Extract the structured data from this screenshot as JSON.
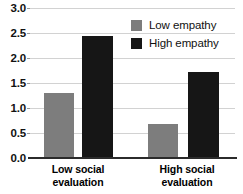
{
  "chart_data": {
    "type": "bar",
    "title": "",
    "subtitle": "",
    "xlabel": "",
    "ylabel": "",
    "categories": [
      "Low social evaluation",
      "High social evaluation"
    ],
    "category_lines": [
      [
        "Low social",
        "evaluation"
      ],
      [
        "High social",
        "evaluation"
      ]
    ],
    "series": [
      {
        "name": "Low empathy",
        "color": "#7d7d7d",
        "values": [
          1.3,
          0.68
        ]
      },
      {
        "name": "High empathy",
        "color": "#161616",
        "values": [
          2.44,
          1.72
        ]
      }
    ],
    "ylim": [
      0.0,
      3.0
    ],
    "ytick_values": [
      3.0,
      2.5,
      2.0,
      1.5,
      1.0,
      0.5,
      0.0
    ],
    "ytick_labels": [
      "3.0",
      "2.5",
      "2.0",
      "1.5",
      "1.0",
      "0.5",
      "0.0"
    ],
    "grid": true,
    "grid_axis": "y",
    "grid_color": "#d2d2d2",
    "legend_position": "top-right",
    "axis_color": "#2b2b2b",
    "background_color": "#ffffff"
  }
}
